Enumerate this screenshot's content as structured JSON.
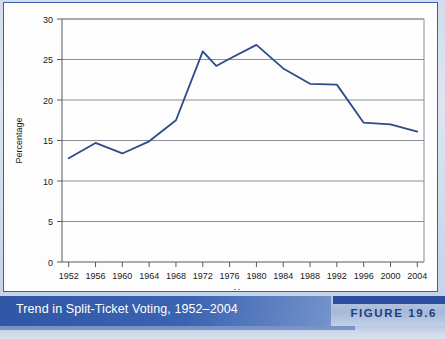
{
  "caption": {
    "title": "Trend in Split-Ticket Voting, 1952–2004",
    "figure_label": "FIGURE 19.6"
  },
  "colors": {
    "line": "#2d4a8a",
    "caption_bar": "#2f57a5",
    "panel_border": "#3d5fa8",
    "grid": "#8a8f95",
    "axis": "#555a5f",
    "caption_text": "#ffffff",
    "figure_label_text": "#203e7d"
  },
  "chart_data": {
    "type": "line",
    "title": "Trend in Split-Ticket Voting, 1952–2004",
    "xlabel": "Year",
    "ylabel": "Percentage",
    "xlim": [
      1951,
      2005
    ],
    "ylim": [
      0,
      30
    ],
    "yticks": [
      0,
      5,
      10,
      15,
      20,
      25,
      30
    ],
    "ytick_labels": [
      "0",
      "5",
      "10",
      "15",
      "20",
      "25",
      "30"
    ],
    "xticks": [
      1952,
      1956,
      1960,
      1964,
      1968,
      1972,
      1976,
      1980,
      1984,
      1988,
      1992,
      1996,
      2000,
      2004
    ],
    "xtick_labels": [
      "1952",
      "1956",
      "1960",
      "1964",
      "1968",
      "1972",
      "1976",
      "1980",
      "1984",
      "1988",
      "1992",
      "1996",
      "2000",
      "2004"
    ],
    "grid": "horizontal",
    "legend": "none",
    "series": [
      {
        "name": "Split-ticket voting",
        "color": "#2d4a8a",
        "x": [
          1952,
          1956,
          1960,
          1964,
          1968,
          1972,
          1974,
          1976,
          1980,
          1984,
          1988,
          1992,
          1996,
          2000,
          2004
        ],
        "values": [
          12.8,
          14.7,
          13.4,
          14.9,
          17.5,
          26.0,
          24.2,
          25.1,
          26.8,
          23.9,
          22.0,
          21.9,
          17.2,
          17.0,
          16.1
        ]
      }
    ]
  }
}
